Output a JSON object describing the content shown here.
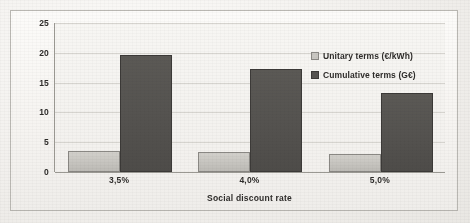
{
  "figure": {
    "frame_visible": true,
    "background_note": "scanned document"
  },
  "chart_data": {
    "type": "bar",
    "title": "",
    "subtitle": "",
    "xlabel": "Social discount rate",
    "ylabel": "€/kWh   G€",
    "categories": [
      "3,5%",
      "4,0%",
      "5,0%"
    ],
    "series": [
      {
        "name": "Unitary terms (€/kWh)",
        "values": [
          3.5,
          3.3,
          3.0
        ],
        "color": "#c9c7c2"
      },
      {
        "name": "Cumulative terms (G€)",
        "values": [
          19.7,
          17.3,
          13.3
        ],
        "color": "#555350"
      }
    ],
    "ylim": [
      0,
      25
    ],
    "yticks": [
      0,
      5,
      10,
      15,
      20,
      25
    ],
    "ytick_labels": [
      "0",
      "5",
      "10",
      "15",
      "20",
      "25"
    ],
    "grid": true,
    "grid_axis": "y",
    "legend_position": "upper right",
    "legend": [
      "Unitary terms (€/kWh)",
      "Cumulative terms (G€)"
    ]
  },
  "axis": {
    "y_title": "€/kWh   G€",
    "x_title": "Social discount rate"
  }
}
